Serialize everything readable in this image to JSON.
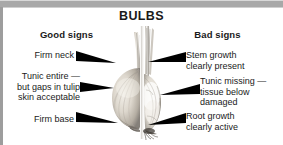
{
  "figure": {
    "title": "BULBS",
    "headings": {
      "good": "Good signs",
      "bad": "Bad signs"
    },
    "image_alt": "bulb-cross-section-photo",
    "colors": {
      "frame": "#a8a8a8",
      "text": "#1a1a1a",
      "arrow": "#000000",
      "background": "#ffffff"
    }
  },
  "good_signs": [
    {
      "id": "firm-neck",
      "lines": [
        "Firm neck"
      ]
    },
    {
      "id": "tunic-entire",
      "lines": [
        "Tunic entire —",
        "but gaps in tulip",
        "skin acceptable"
      ]
    },
    {
      "id": "firm-base",
      "lines": [
        "Firm base"
      ]
    }
  ],
  "bad_signs": [
    {
      "id": "stem-growth",
      "lines": [
        "Stem growth",
        "clearly present"
      ]
    },
    {
      "id": "tunic-missing",
      "lines": [
        "Tunic missing —",
        "tissue below",
        "damaged"
      ]
    },
    {
      "id": "root-growth",
      "lines": [
        "Root growth",
        "clearly active"
      ]
    }
  ]
}
